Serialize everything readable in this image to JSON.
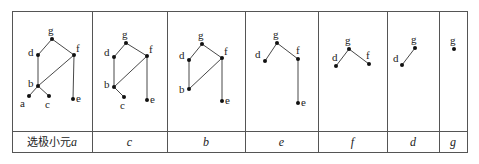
{
  "table": {
    "left": 12,
    "top": 11,
    "right": 467,
    "bottom": 152,
    "row_divider_y": 131,
    "column_edges": [
      12,
      92,
      167,
      245,
      318,
      387,
      439,
      467
    ]
  },
  "colors": {
    "line": "#333333",
    "node": "#111111",
    "border": "#555555"
  },
  "columns": [
    {
      "caption_prefix": "选极小元",
      "caption_var": "a",
      "nodes": {
        "g": [
          52,
          39
        ],
        "d": [
          38,
          55
        ],
        "f": [
          74,
          55
        ],
        "b": [
          38,
          86
        ],
        "a": [
          29,
          96
        ],
        "c": [
          49,
          96
        ],
        "e": [
          73,
          99
        ]
      },
      "edges": [
        [
          "g",
          "d"
        ],
        [
          "g",
          "f"
        ],
        [
          "d",
          "b"
        ],
        [
          "f",
          "b"
        ],
        [
          "f",
          "e"
        ],
        [
          "b",
          "a"
        ],
        [
          "b",
          "c"
        ]
      ],
      "labels": {
        "g": [
          -4,
          -14
        ],
        "d": [
          -10,
          -8
        ],
        "f": [
          2,
          -12
        ],
        "b": [
          -10,
          -8
        ],
        "a": [
          -9,
          2
        ],
        "c": [
          -4,
          3
        ],
        "e": [
          3,
          -6
        ]
      }
    },
    {
      "caption_prefix": "",
      "caption_var": "c",
      "nodes": {
        "g": [
          126,
          43
        ],
        "d": [
          114,
          57
        ],
        "f": [
          147,
          56
        ],
        "b": [
          114,
          87
        ],
        "c": [
          124,
          97
        ],
        "e": [
          147,
          100
        ]
      },
      "edges": [
        [
          "g",
          "d"
        ],
        [
          "g",
          "f"
        ],
        [
          "d",
          "b"
        ],
        [
          "f",
          "b"
        ],
        [
          "f",
          "e"
        ],
        [
          "b",
          "c"
        ]
      ],
      "labels": {
        "g": [
          -4,
          -14
        ],
        "d": [
          -10,
          -10
        ],
        "f": [
          2,
          -12
        ],
        "b": [
          -10,
          -8
        ],
        "c": [
          -4,
          3
        ],
        "e": [
          3,
          -6
        ]
      }
    },
    {
      "caption_prefix": "",
      "caption_var": "b",
      "nodes": {
        "g": [
          202,
          44
        ],
        "d": [
          189,
          60
        ],
        "f": [
          222,
          58
        ],
        "b": [
          189,
          89
        ],
        "e": [
          222,
          101
        ]
      },
      "edges": [
        [
          "g",
          "d"
        ],
        [
          "g",
          "f"
        ],
        [
          "d",
          "b"
        ],
        [
          "f",
          "b"
        ],
        [
          "f",
          "e"
        ]
      ],
      "labels": {
        "g": [
          -4,
          -14
        ],
        "d": [
          -10,
          -10
        ],
        "f": [
          2,
          -12
        ],
        "b": [
          -10,
          -5
        ],
        "e": [
          3,
          -6
        ]
      }
    },
    {
      "caption_prefix": "",
      "caption_var": "e",
      "nodes": {
        "g": [
          277,
          43
        ],
        "d": [
          265,
          61
        ],
        "f": [
          298,
          59
        ],
        "e": [
          298,
          103
        ]
      },
      "edges": [
        [
          "g",
          "d"
        ],
        [
          "g",
          "f"
        ],
        [
          "f",
          "e"
        ]
      ],
      "labels": {
        "g": [
          -4,
          -14
        ],
        "d": [
          -10,
          -12
        ],
        "f": [
          -2,
          -14
        ],
        "e": [
          3,
          -6
        ]
      }
    },
    {
      "caption_prefix": "",
      "caption_var": "f",
      "nodes": {
        "g": [
          349,
          49
        ],
        "d": [
          336,
          66
        ],
        "f": [
          369,
          64
        ]
      },
      "edges": [
        [
          "g",
          "d"
        ],
        [
          "g",
          "f"
        ]
      ],
      "labels": {
        "g": [
          -4,
          -14
        ],
        "d": [
          -4,
          -14
        ],
        "f": [
          -3,
          -14
        ]
      }
    },
    {
      "caption_prefix": "",
      "caption_var": "d",
      "nodes": {
        "g": [
          415,
          48
        ],
        "d": [
          402,
          65
        ]
      },
      "edges": [
        [
          "g",
          "d"
        ]
      ],
      "labels": {
        "g": [
          -4,
          -14
        ],
        "d": [
          -9,
          -12
        ]
      }
    },
    {
      "caption_prefix": "",
      "caption_var": "g",
      "nodes": {
        "g": [
          454,
          49
        ]
      },
      "edges": [],
      "labels": {
        "g": [
          -4,
          -14
        ]
      }
    }
  ]
}
